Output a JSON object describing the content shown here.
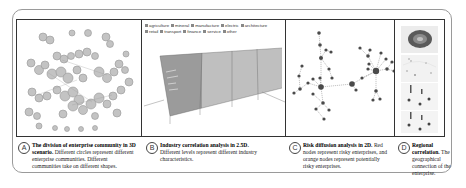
{
  "figure": {
    "panels": [
      {
        "id": "A",
        "letter": "A",
        "title": "The division of enterprise community in 3D scenario.",
        "description": "Different circles represent different enterprise communities. Different communities take on different shapes.",
        "visual": "3d-community-bubble-cluster"
      },
      {
        "id": "B",
        "letter": "B",
        "title": "Industry correlation analysis in 2.5D.",
        "description": "Different levels represent different industry characteristics.",
        "visual": "2.5d-layered-parallel-lines",
        "legend": [
          "agriculture",
          "mineral",
          "manufacture",
          "electric",
          "architecture",
          "retail",
          "transport",
          "finance",
          "service",
          "other"
        ]
      },
      {
        "id": "C",
        "letter": "C",
        "title": "Risk diffusion analysis in 2D.",
        "description": "Red nodes represent risky enterprises, and orange nodes represent potentially risky enterprises.",
        "visual": "node-link-network"
      },
      {
        "id": "D",
        "letter": "D",
        "title": "Regional correlation.",
        "description": "The geographical connection of the enterprise.",
        "visual": "stacked-map-tiles"
      }
    ],
    "colors": {
      "border": "#333333",
      "outer_border": "#9a9a9a",
      "node": "#4a4a4a",
      "edge": "#8a8a8a",
      "bubble": "#b5b5b5"
    }
  }
}
